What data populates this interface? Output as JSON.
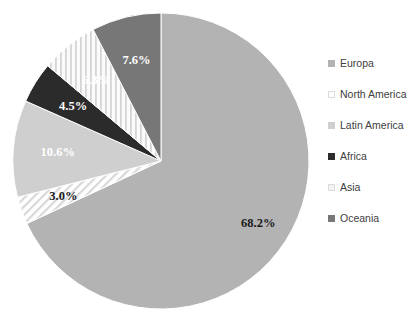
{
  "chart_data": {
    "type": "pie",
    "title": "",
    "categories": [
      "Europa",
      "North America",
      "Latin America",
      "Africa",
      "Asia",
      "Oceania"
    ],
    "values": [
      68.2,
      3.0,
      10.6,
      4.5,
      6.3,
      7.6
    ],
    "value_labels": [
      "68.2%",
      "3.0%",
      "10.6%",
      "4.5%",
      "6.3%",
      "7.6%"
    ],
    "unit": "%",
    "start_angle_deg": 0,
    "direction": "clockwise",
    "legend_position": "right",
    "grid": false,
    "colors": [
      "#b3b3b3",
      "#fdfdfd",
      "#cfcfcf",
      "#2b2b2b",
      "#f4f4f4",
      "#777777"
    ],
    "patterns": [
      "solid",
      "diagonal-hatch",
      "solid",
      "solid",
      "vertical-stripes",
      "solid"
    ],
    "label_colors": [
      "#1a1a1a",
      "#1a1a1a",
      "#ffffff",
      "#ffffff",
      "#ffffff",
      "#ffffff"
    ]
  },
  "legend": {
    "items": [
      {
        "label": "Europa",
        "color": "#b3b3b3"
      },
      {
        "label": "North America",
        "color": "#fdfdfd"
      },
      {
        "label": "Latin America",
        "color": "#cfcfcf"
      },
      {
        "label": "Africa",
        "color": "#2b2b2b"
      },
      {
        "label": "Asia",
        "color": "#f4f4f4"
      },
      {
        "label": "Oceania",
        "color": "#777777"
      }
    ]
  }
}
